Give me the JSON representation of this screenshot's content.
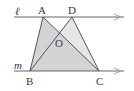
{
  "diagram": {
    "type": "geometry",
    "lines": [
      {
        "name": "l",
        "label": "ℓ"
      },
      {
        "name": "m",
        "label": "m"
      }
    ],
    "points": {
      "A": {
        "label": "A"
      },
      "D": {
        "label": "D"
      },
      "O": {
        "label": "O"
      },
      "B": {
        "label": "B"
      },
      "C": {
        "label": "C"
      }
    },
    "colors": {
      "stroke": "#4a4a4a",
      "shade_dark": "#d2d2d2",
      "shade_light": "#e6e6e6",
      "arrow": "#8a8a8a"
    }
  }
}
